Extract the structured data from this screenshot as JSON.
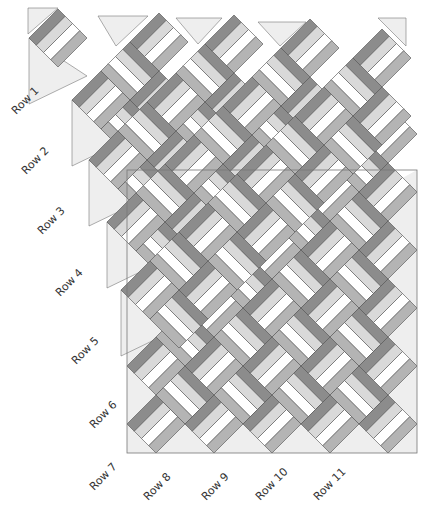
{
  "diagram": {
    "colors": {
      "dark_rail": "#8c8c8c",
      "mid_rail": "#b4b4b4",
      "light_rail": "#d9d9d9",
      "white_rail": "#ffffff",
      "outline": "#555555",
      "setting_triangle": "#eeeeee",
      "background": "#ffffff"
    },
    "half_diagonal_px": 29,
    "row_labels": [
      {
        "label": "Row 1",
        "x": 18,
        "y": 118
      },
      {
        "label": "Row 2",
        "x": 28,
        "y": 178
      },
      {
        "label": "Row 3",
        "x": 44,
        "y": 238
      },
      {
        "label": "Row 4",
        "x": 62,
        "y": 300
      },
      {
        "label": "Row 5",
        "x": 78,
        "y": 368
      },
      {
        "label": "Row 6",
        "x": 96,
        "y": 432
      },
      {
        "label": "Row 7",
        "x": 96,
        "y": 494
      },
      {
        "label": "Row 8",
        "x": 150,
        "y": 504
      },
      {
        "label": "Row 9",
        "x": 208,
        "y": 504
      },
      {
        "label": "Row 10",
        "x": 262,
        "y": 504
      },
      {
        "label": "Row 11",
        "x": 320,
        "y": 504
      }
    ]
  }
}
